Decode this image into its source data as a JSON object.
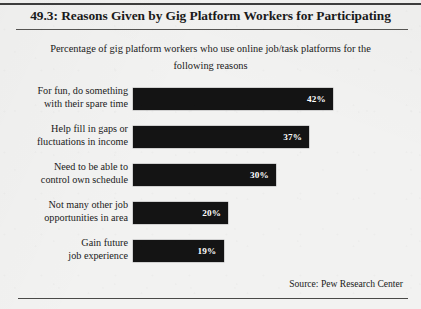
{
  "figure": {
    "title": "49.3: Reasons Given by Gig Platform Workers for Participating",
    "subtitle_line1": "Percentage of gig platform workers who use online job/task",
    "subtitle_line2": "platforms for the following reasons",
    "source": "Source:  Pew Research Center"
  },
  "chart_data": {
    "type": "bar",
    "orientation": "horizontal",
    "title": "49.3: Reasons Given by Gig Platform Workers for Participating",
    "subtitle": "Percentage of gig platform workers who use online job/task platforms for the following reasons",
    "xlabel": "",
    "ylabel": "",
    "xlim": [
      0,
      42
    ],
    "grid": false,
    "legend": false,
    "bar_color": "#141414",
    "value_label_color": "#ffffff",
    "categories": [
      "For fun, do something with their spare time",
      "Help fill in gaps or fluctuations in income",
      "Need to be able to control own schedule",
      "Not many other job opportunities in area",
      "Gain future job experience"
    ],
    "values": [
      42,
      37,
      30,
      20,
      19
    ],
    "value_labels": [
      "42%",
      "37%",
      "30%",
      "20%",
      "19%"
    ],
    "source": "Source:  Pew Research Center"
  },
  "rows": [
    {
      "label_line1": "For fun, do something",
      "label_line2": "with their spare time",
      "value_label": "42%",
      "bar_width_px": "200px",
      "top_px": "0px"
    },
    {
      "label_line1": "Help fill in gaps or",
      "label_line2": "fluctuations in income",
      "value_label": "37%",
      "bar_width_px": "176px",
      "top_px": "38px"
    },
    {
      "label_line1": "Need to be able to",
      "label_line2": "control own schedule",
      "value_label": "30%",
      "bar_width_px": "143px",
      "top_px": "76px"
    },
    {
      "label_line1": "Not many other job",
      "label_line2": "opportunities in area",
      "value_label": "20%",
      "bar_width_px": "95px",
      "top_px": "114px"
    },
    {
      "label_line1": "Gain future",
      "label_line2": "job experience",
      "value_label": "19%",
      "bar_width_px": "91px",
      "top_px": "152px"
    }
  ]
}
